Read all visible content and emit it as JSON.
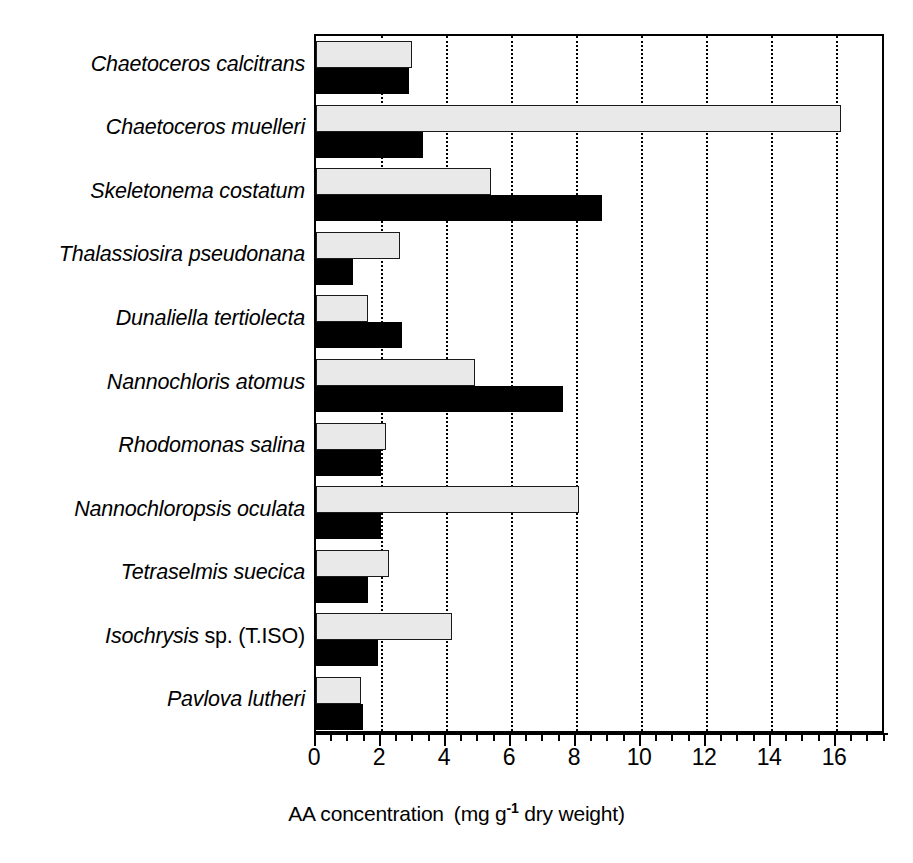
{
  "chart_data": {
    "type": "bar",
    "orientation": "horizontal",
    "title": "",
    "xlabel": "AA concentration  (mg g-1 dry weight)",
    "xlabel_parts": {
      "main": "AA concentration",
      "paren_open": "(mg g",
      "exponent": "-1",
      "paren_rest": " dry weight)"
    },
    "ylabel": "",
    "xlim": [
      0,
      17.54
    ],
    "xticks": [
      0,
      2,
      4,
      6,
      8,
      10,
      12,
      14,
      16
    ],
    "xticklabels": [
      "0",
      "2",
      "4",
      "6",
      "8",
      "10",
      "12",
      "14",
      "16"
    ],
    "minor_tick_step": 0.5,
    "grid": "vertical dotted at major ticks",
    "legend": "none",
    "categories": [
      "Chaetoceros calcitrans",
      "Chaetoceros muelleri",
      "Skeletonema costatum",
      "Thalassiosira pseudonana",
      "Dunaliella tertiolecta",
      "Nannochloris atomus",
      "Rhodomonas salina",
      "Nannochloropsis oculata",
      "Tetraselmis suecica",
      "Isochrysis sp. (T.ISO)",
      "Pavlova lutheri"
    ],
    "category_label_styles": [
      {
        "italic": "Chaetoceros calcitrans",
        "roman": ""
      },
      {
        "italic": "Chaetoceros muelleri",
        "roman": ""
      },
      {
        "italic": "Skeletonema costatum",
        "roman": ""
      },
      {
        "italic": "Thalassiosira pseudonana",
        "roman": ""
      },
      {
        "italic": "Dunaliella tertiolecta",
        "roman": ""
      },
      {
        "italic": "Nannochloris atomus",
        "roman": ""
      },
      {
        "italic": "Rhodomonas salina",
        "roman": ""
      },
      {
        "italic": "Nannochloropsis oculata",
        "roman": ""
      },
      {
        "italic": "Tetraselmis suecica",
        "roman": ""
      },
      {
        "italic": "Isochrysis",
        "roman": " sp. (T.ISO)"
      },
      {
        "italic": "Pavlova lutheri",
        "roman": ""
      }
    ],
    "series": [
      {
        "name": "gray",
        "color": "#e9e9e9",
        "edgecolor": "#1a1a1a",
        "values": [
          2.95,
          16.15,
          5.4,
          2.6,
          1.6,
          4.9,
          2.15,
          8.1,
          2.25,
          4.2,
          1.4
        ]
      },
      {
        "name": "black",
        "color": "#000000",
        "edgecolor": "#000000",
        "values": [
          2.85,
          3.3,
          8.8,
          1.15,
          2.65,
          7.6,
          2.0,
          2.0,
          1.6,
          1.9,
          1.45
        ]
      }
    ]
  },
  "colors": {
    "background": "#ffffff",
    "axis": "#000000",
    "bar_gray_fill": "#e9e9e9",
    "bar_black_fill": "#000000"
  }
}
